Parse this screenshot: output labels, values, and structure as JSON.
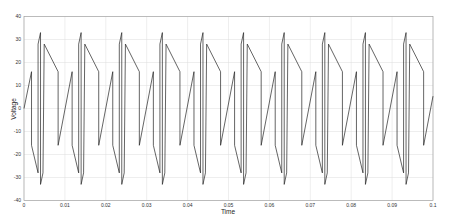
{
  "chart_data": {
    "type": "line",
    "title": "",
    "xlabel": "Time",
    "ylabel": "Voltage",
    "xlim": [
      0,
      0.1
    ],
    "ylim": [
      -40,
      40
    ],
    "grid": true,
    "legend": null,
    "x_ticks": [
      "0",
      "0.01",
      "0.02",
      "0.03",
      "0.04",
      "0.05",
      "0.06",
      "0.07",
      "0.08",
      "0.09",
      "0.1"
    ],
    "y_ticks": [
      "40",
      "30",
      "20",
      "10",
      "0",
      "-10",
      "-20",
      "-30",
      "-40"
    ],
    "series": [
      {
        "name": "Voltage",
        "color": "#222222",
        "description": "Periodic multilevel waveform, period ~0.01 s: ramp -16 to +16 V, step to -16, slope to -28, jump to +28, peak +33, drop to -33, rise to -28, jump to +28, slope to +16, step to -16, repeat",
        "period": 0.00993,
        "first_peak_t": 0.00184,
        "template": [
          [
            0.0,
            16
          ],
          [
            0.0,
            -16
          ],
          [
            0.0016,
            -28
          ],
          [
            0.0016,
            28
          ],
          [
            0.0022,
            33
          ],
          [
            0.0022,
            -33
          ],
          [
            0.0028,
            -28
          ],
          [
            0.0031,
            28
          ],
          [
            0.0065,
            16
          ],
          [
            0.0065,
            -16
          ],
          [
            0.00993,
            16
          ]
        ]
      }
    ]
  }
}
